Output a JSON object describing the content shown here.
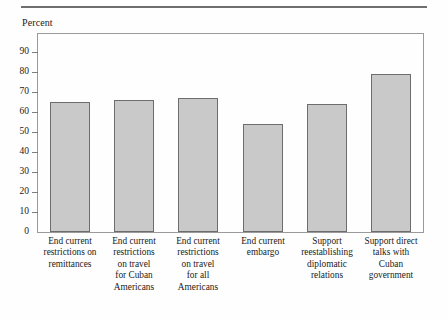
{
  "figure": {
    "axis_caption": "Percent",
    "has_top_rule": true,
    "frame_color": "#9a9a9a",
    "bar_fill": "#c9c9c9",
    "bar_stroke": "#6d6d6d"
  },
  "chart_data": {
    "type": "bar",
    "title": "",
    "subtitle": "",
    "xlabel": "",
    "ylabel": "Percent",
    "ylim": [
      0,
      99
    ],
    "grid": false,
    "legend": "none",
    "ytick_labels": [
      "0",
      "10",
      "20",
      "30",
      "40",
      "50",
      "60",
      "70",
      "80",
      "90"
    ],
    "ytick_values": [
      0,
      10,
      20,
      30,
      40,
      50,
      60,
      70,
      80,
      90
    ],
    "categories": [
      "End current restrictions on remittances",
      "End current restrictions on travel for Cuban Americans",
      "End current restrictions on travel for all Americans",
      "End current embargo",
      "Support reestablishing diplomatic relations",
      "Support direct talks with Cuban government"
    ],
    "category_lines": [
      [
        "End current",
        "restrictions on",
        "remittances"
      ],
      [
        "End current",
        "restrictions",
        "on travel",
        "for Cuban",
        "Americans"
      ],
      [
        "End current",
        "restrictions",
        "on travel",
        "for all",
        "Americans"
      ],
      [
        "End current",
        "embargo"
      ],
      [
        "Support",
        "reestablishing",
        "diplomatic",
        "relations"
      ],
      [
        "Support direct",
        "talks with",
        "Cuban",
        "government"
      ]
    ],
    "values": [
      65,
      66,
      67,
      54,
      64,
      79
    ]
  }
}
